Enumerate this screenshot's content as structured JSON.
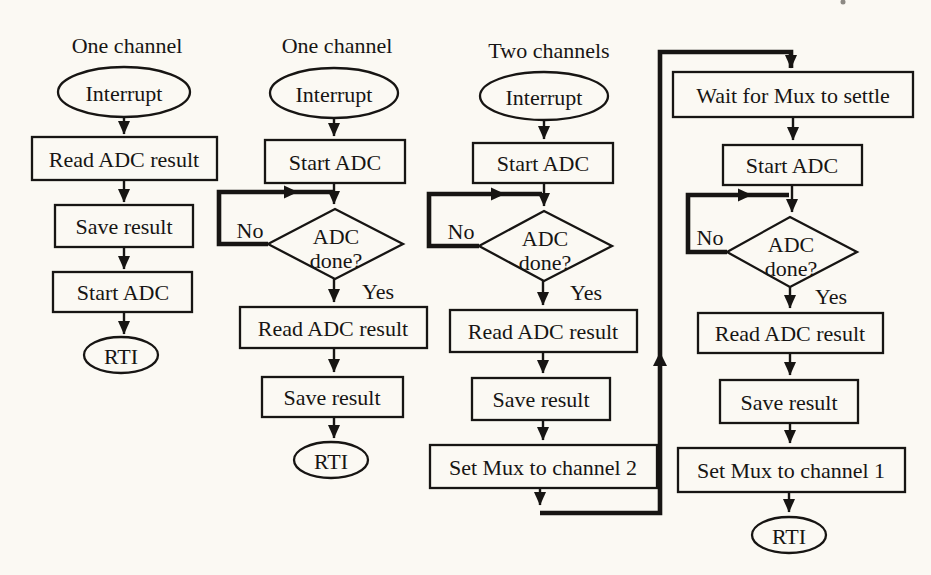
{
  "figure": {
    "background_color": "#fbf9f3",
    "ink_color": "#171513",
    "columns": [
      {
        "id": "one-channel-simple",
        "title": "One channel",
        "terminal_start": "Interrupt",
        "boxes": [
          "Read ADC result",
          "Save result",
          "Start ADC"
        ],
        "terminal_end": "RTI"
      },
      {
        "id": "one-channel-polled",
        "title": "One channel",
        "terminal_start": "Interrupt",
        "box_start_adc": "Start ADC",
        "decision_line1": "ADC",
        "decision_line2": "done?",
        "label_no": "No",
        "label_yes": "Yes",
        "boxes": [
          "Read ADC result",
          "Save result"
        ],
        "terminal_end": "RTI"
      },
      {
        "id": "two-channels-part1",
        "title": "Two channels",
        "terminal_start": "Interrupt",
        "box_start_adc": "Start ADC",
        "decision_line1": "ADC",
        "decision_line2": "done?",
        "label_no": "No",
        "label_yes": "Yes",
        "boxes": [
          "Read ADC result",
          "Save result",
          "Set Mux to channel 2"
        ]
      },
      {
        "id": "two-channels-part2",
        "box_wait": "Wait for Mux to settle",
        "box_start_adc": "Start ADC",
        "decision_line1": "ADC",
        "decision_line2": "done?",
        "label_no": "No",
        "label_yes": "Yes",
        "boxes": [
          "Read ADC result",
          "Save result",
          "Set Mux to channel 1"
        ],
        "terminal_end": "RTI"
      }
    ]
  }
}
